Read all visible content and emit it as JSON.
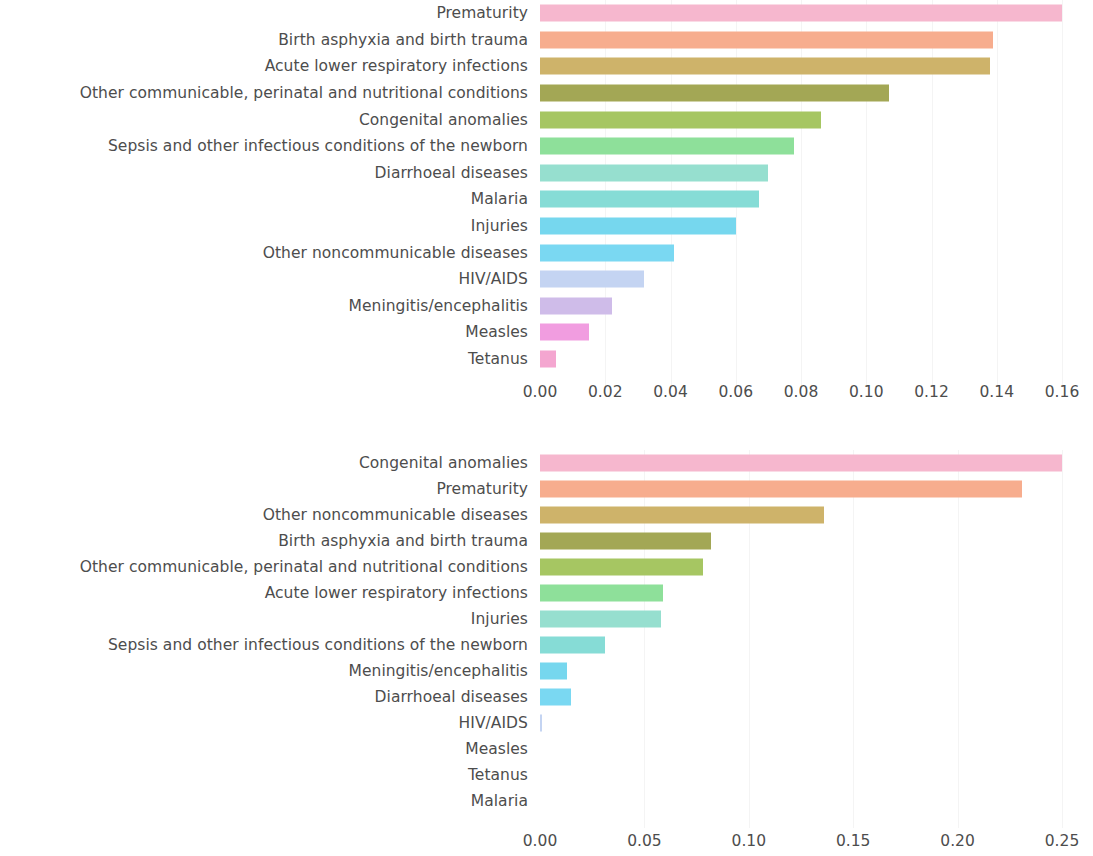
{
  "chart_data": [
    {
      "type": "bar",
      "orientation": "horizontal",
      "panel": "top",
      "title": "",
      "xlabel": "",
      "ylabel": "",
      "xlim": [
        0.0,
        0.167
      ],
      "xticks": [
        0.0,
        0.02,
        0.04,
        0.06,
        0.08,
        0.1,
        0.12,
        0.14,
        0.16
      ],
      "xtick_labels": [
        "0.00",
        "0.02",
        "0.04",
        "0.06",
        "0.08",
        "0.10",
        "0.12",
        "0.14",
        "0.16"
      ],
      "grid": false,
      "legend": "none",
      "categories": [
        "Prematurity",
        "Birth asphyxia and birth trauma",
        "Acute lower respiratory infections",
        "Other communicable, perinatal and nutritional conditions",
        "Congenital anomalies",
        "Sepsis and other infectious conditions of the newborn",
        "Diarrhoeal diseases",
        "Malaria",
        "Injuries",
        "Other noncommunicable diseases",
        "HIV/AIDS",
        "Meningitis/encephalitis",
        "Measles",
        "Tetanus"
      ],
      "values": [
        0.16,
        0.139,
        0.138,
        0.107,
        0.086,
        0.078,
        0.07,
        0.067,
        0.06,
        0.041,
        0.032,
        0.022,
        0.015,
        0.005
      ],
      "colors": [
        "#f6b7ce",
        "#f7ad8e",
        "#ceb36a",
        "#a3a755",
        "#a6c662",
        "#8ee09a",
        "#96dfcf",
        "#86dcd6",
        "#76d7ee",
        "#7ad8f2",
        "#c4d4f2",
        "#cfbce9",
        "#f19de0",
        "#f4a6d0"
      ]
    },
    {
      "type": "bar",
      "orientation": "horizontal",
      "panel": "bottom",
      "title": "",
      "xlabel": "",
      "ylabel": "",
      "xlim": [
        0.0,
        0.262
      ],
      "xticks": [
        0.0,
        0.05,
        0.1,
        0.15,
        0.2,
        0.25
      ],
      "xtick_labels": [
        "0.00",
        "0.05",
        "0.10",
        "0.15",
        "0.20",
        "0.25"
      ],
      "grid": false,
      "legend": "none",
      "categories": [
        "Congenital anomalies",
        "Prematurity",
        "Other noncommunicable diseases",
        "Birth asphyxia and birth trauma",
        "Other communicable, perinatal and nutritional conditions",
        "Acute lower respiratory infections",
        "Injuries",
        "Sepsis and other infectious conditions of the newborn",
        "Meningitis/encephalitis",
        "Diarrhoeal diseases",
        "HIV/AIDS",
        "Measles",
        "Tetanus",
        "Malaria"
      ],
      "values": [
        0.25,
        0.231,
        0.136,
        0.082,
        0.078,
        0.059,
        0.058,
        0.031,
        0.013,
        0.015,
        0.001,
        0.0,
        0.0,
        0.0
      ],
      "colors": [
        "#f6b7ce",
        "#f7ad8e",
        "#ceb36a",
        "#a3a755",
        "#a6c662",
        "#8ee09a",
        "#96dfcf",
        "#86dcd6",
        "#76d7ee",
        "#7ad8f2",
        "#c4d4f2",
        "#cfbce9",
        "#f19de0",
        "#f4a6d0"
      ]
    }
  ]
}
